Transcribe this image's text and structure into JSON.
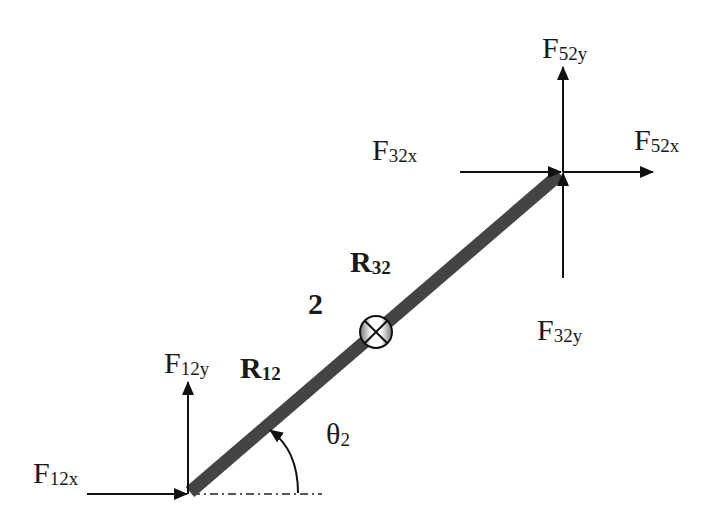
{
  "diagram": {
    "type": "free-body-diagram",
    "link_label": "2",
    "angle": {
      "symbol": "θ",
      "subscript": "2"
    },
    "position_vectors": [
      {
        "id": "R12",
        "main": "R",
        "sub": "12"
      },
      {
        "id": "R32",
        "main": "R",
        "sub": "32"
      }
    ],
    "forces": [
      {
        "id": "F12x",
        "main": "F",
        "sub": "12x",
        "direction": "right",
        "joint": "lower"
      },
      {
        "id": "F12y",
        "main": "F",
        "sub": "12y",
        "direction": "up",
        "joint": "lower"
      },
      {
        "id": "F32x",
        "main": "F",
        "sub": "32x",
        "direction": "right",
        "joint": "upper"
      },
      {
        "id": "F32y",
        "main": "F",
        "sub": "32y",
        "direction": "up",
        "joint": "upper"
      },
      {
        "id": "F52x",
        "main": "F",
        "sub": "52x",
        "direction": "right",
        "joint": "upper"
      },
      {
        "id": "F52y",
        "main": "F",
        "sub": "52y",
        "direction": "up",
        "joint": "upper"
      }
    ],
    "center_of_mass_symbol": "⊗",
    "colors": {
      "link": "#444444",
      "lines": "#111111",
      "background": "#ffffff"
    }
  }
}
